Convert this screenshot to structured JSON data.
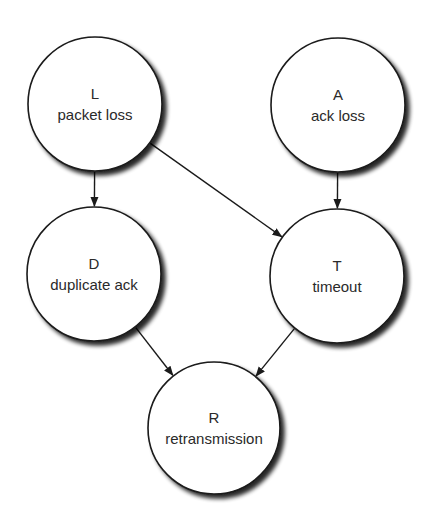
{
  "diagram": {
    "type": "causal-graph",
    "colors": {
      "background": "#ffffff",
      "stroke": "#1a1a1a",
      "shadow": "#000000",
      "text": "#2a2a2a"
    },
    "nodes": [
      {
        "id": "L",
        "symbol": "L",
        "label": "packet loss",
        "cx": 95,
        "cy": 104,
        "r": 67
      },
      {
        "id": "A",
        "symbol": "A",
        "label": "ack loss",
        "cx": 338,
        "cy": 105,
        "r": 67
      },
      {
        "id": "D",
        "symbol": "D",
        "label": "duplicate ack",
        "cx": 94,
        "cy": 274,
        "r": 67
      },
      {
        "id": "T",
        "symbol": "T",
        "label": "timeout",
        "cx": 337,
        "cy": 276,
        "r": 67
      },
      {
        "id": "R",
        "symbol": "R",
        "label": "retransmission",
        "cx": 214,
        "cy": 428,
        "r": 66
      }
    ],
    "edges": [
      {
        "from": "L",
        "to": "D"
      },
      {
        "from": "L",
        "to": "T"
      },
      {
        "from": "A",
        "to": "T"
      },
      {
        "from": "D",
        "to": "R"
      },
      {
        "from": "T",
        "to": "R"
      }
    ]
  }
}
